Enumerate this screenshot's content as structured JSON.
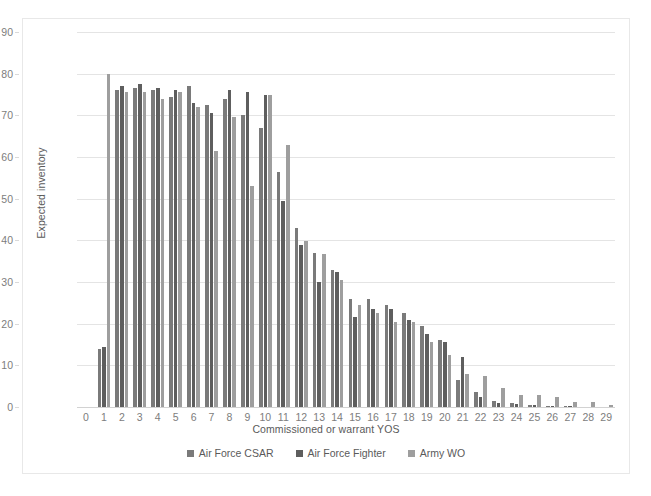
{
  "chart_data": {
    "type": "bar",
    "title": "",
    "xlabel": "Commissioned or warrant YOS",
    "ylabel": "Expected inventory",
    "ylim": [
      0,
      90
    ],
    "y_ticks": [
      0,
      10,
      20,
      30,
      40,
      50,
      60,
      70,
      80,
      90
    ],
    "grid": true,
    "legend_position": "bottom",
    "categories": [
      "0",
      "1",
      "2",
      "3",
      "4",
      "5",
      "6",
      "7",
      "8",
      "9",
      "10",
      "11",
      "12",
      "13",
      "14",
      "15",
      "16",
      "17",
      "18",
      "19",
      "20",
      "21",
      "22",
      "23",
      "24",
      "25",
      "26",
      "27",
      "28",
      "29"
    ],
    "series": [
      {
        "name": "Air Force CSAR",
        "color": "#7a7a7a",
        "values": [
          0,
          14,
          76,
          76.5,
          76,
          74.5,
          77,
          72.5,
          74,
          70,
          67,
          56.5,
          43,
          37,
          33,
          26,
          26,
          24.5,
          22.5,
          19.5,
          16,
          6.5,
          3.5,
          1.5,
          1,
          0.5,
          0.3,
          0.2,
          0.1,
          0.1
        ]
      },
      {
        "name": "Air Force Fighter",
        "color": "#5e5e5e",
        "values": [
          0,
          14.3,
          77,
          77.5,
          76.5,
          76,
          73,
          70.5,
          76,
          75.5,
          74.8,
          49.5,
          39,
          30,
          32.5,
          21.5,
          23.5,
          23.5,
          21,
          17.5,
          15.5,
          12,
          2.5,
          1,
          0.8,
          0.4,
          0.3,
          0.2,
          0.1,
          0.1
        ]
      },
      {
        "name": "Army WO",
        "color": "#9e9e9e",
        "values": [
          0,
          80,
          75.5,
          75.5,
          74,
          75.5,
          72,
          61.5,
          69.5,
          53,
          74.8,
          62.8,
          39.8,
          36.8,
          30.5,
          24.5,
          22.5,
          20.3,
          20.5,
          15.5,
          12.5,
          8,
          7.5,
          4.5,
          3,
          2.8,
          2.5,
          1.2,
          1.2,
          0.6
        ]
      }
    ]
  },
  "legend": {
    "items": [
      {
        "label": "Air Force CSAR",
        "color": "#7a7a7a"
      },
      {
        "label": "Air Force Fighter",
        "color": "#5e5e5e"
      },
      {
        "label": "Army WO",
        "color": "#9e9e9e"
      }
    ]
  }
}
